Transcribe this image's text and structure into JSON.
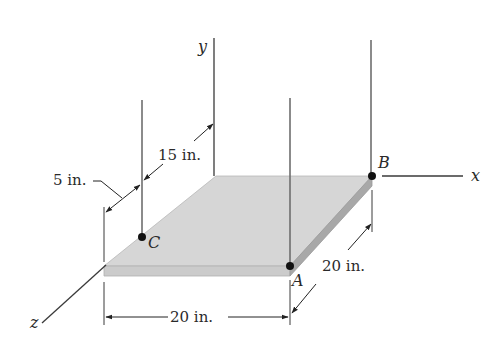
{
  "figure": {
    "type": "engineering-statics-diagram"
  },
  "axes": {
    "x": "x",
    "y": "y",
    "z": "z"
  },
  "points": {
    "A": "A",
    "B": "B",
    "C": "C"
  },
  "dimensions": {
    "width_front": "20 in.",
    "depth_right": "20 in.",
    "offset_15": "15 in.",
    "offset_5": "5 in."
  },
  "colors": {
    "plate_top": "#d6d6d6",
    "plate_edge": "#c4c4c4",
    "plate_side": "#a8a8a8",
    "line": "#3a3a3a",
    "cable": "#6e6e6e",
    "point": "#111111"
  }
}
